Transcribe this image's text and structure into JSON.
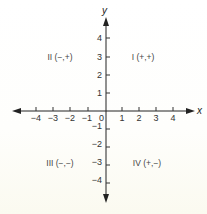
{
  "diagram": {
    "axes": {
      "x_label": "x",
      "y_label": "y",
      "origin_label": "0",
      "x_ticks": [
        {
          "value": -4,
          "label": "−4"
        },
        {
          "value": -3,
          "label": "−3"
        },
        {
          "value": -2,
          "label": "−2"
        },
        {
          "value": -1,
          "label": "−1"
        },
        {
          "value": 1,
          "label": "1"
        },
        {
          "value": 2,
          "label": "2"
        },
        {
          "value": 3,
          "label": "3"
        },
        {
          "value": 4,
          "label": "4"
        }
      ],
      "y_ticks": [
        {
          "value": 4,
          "label": "4"
        },
        {
          "value": 3,
          "label": "3"
        },
        {
          "value": 2,
          "label": "2"
        },
        {
          "value": 1,
          "label": "1"
        },
        {
          "value": -1,
          "label": "−1"
        },
        {
          "value": -2,
          "label": "−2"
        },
        {
          "value": -3,
          "label": "−3"
        },
        {
          "value": -4,
          "label": "−4"
        }
      ]
    },
    "quadrants": {
      "q1": {
        "label": "I (+,+)"
      },
      "q2": {
        "label": "II (−,+)"
      },
      "q3": {
        "label": "III (−,−)"
      },
      "q4": {
        "label": "IV (+,−)"
      }
    },
    "colors": {
      "axis": "#222222",
      "text": "#333333",
      "background": "#fdfdfb"
    }
  }
}
